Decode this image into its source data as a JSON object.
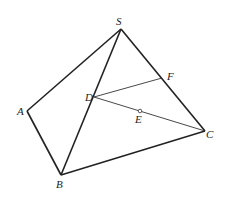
{
  "diagram": {
    "type": "geometry-pyramid",
    "points": {
      "S": {
        "label": "S",
        "x": 121,
        "y": 29,
        "lx": 116,
        "ly": 25
      },
      "A": {
        "label": "A",
        "x": 27,
        "y": 111,
        "lx": 17,
        "ly": 115
      },
      "B": {
        "label": "B",
        "x": 61,
        "y": 175,
        "lx": 56,
        "ly": 188
      },
      "C": {
        "label": "C",
        "x": 205,
        "y": 131,
        "lx": 206,
        "ly": 138
      },
      "D": {
        "label": "D",
        "x": 94,
        "y": 97,
        "lx": 85,
        "ly": 101
      },
      "E": {
        "label": "E",
        "x": 140,
        "y": 111,
        "lx": 135,
        "ly": 123
      },
      "F": {
        "label": "F",
        "x": 162,
        "y": 78,
        "lx": 167,
        "ly": 80
      }
    },
    "edges_thick": [
      [
        "S",
        "A"
      ],
      [
        "A",
        "B"
      ],
      [
        "S",
        "B"
      ],
      [
        "S",
        "C"
      ],
      [
        "B",
        "C"
      ]
    ],
    "edges_thin": [
      [
        "D",
        "F"
      ],
      [
        "D",
        "C"
      ]
    ],
    "marked_point": "E"
  }
}
